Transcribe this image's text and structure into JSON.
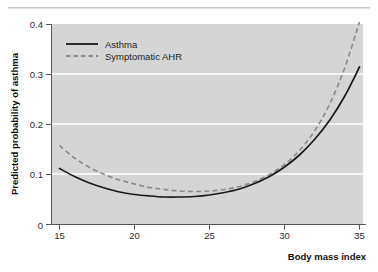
{
  "figure": {
    "background_color": "#ffffff",
    "plot_background_color": "#d5d5d5",
    "grid_color": "#ffffff",
    "top_rule": "horizontal-divider"
  },
  "chart_data": {
    "type": "line",
    "title": "",
    "subtitle": "",
    "xlabel": "Body mass index",
    "ylabel": "Predicted probability of asthma",
    "xlim": [
      14.5,
      35.6
    ],
    "ylim": [
      0,
      0.42
    ],
    "xticks": [
      15,
      20,
      25,
      30,
      35
    ],
    "xticklabels": [
      "15",
      "20",
      "25",
      "30",
      "35"
    ],
    "yticks": [
      0,
      0.1,
      0.2,
      0.3,
      0.4
    ],
    "yticklabels": [
      "0",
      "0.1",
      "0.2",
      "0.3",
      "0.4"
    ],
    "grid": "horizontal-only-at-0.1-0.2-0.3",
    "legend_position": "upper-left-inside",
    "x": [
      15,
      16,
      17,
      18,
      19,
      20,
      21,
      22,
      23,
      24,
      25,
      26,
      27,
      28,
      29,
      30,
      31,
      32,
      33,
      34,
      35
    ],
    "series": [
      {
        "name": "Asthma",
        "style": "solid",
        "color": "#1a1a1a",
        "values": [
          0.112,
          0.096,
          0.083,
          0.073,
          0.065,
          0.06,
          0.057,
          0.055,
          0.055,
          0.056,
          0.059,
          0.064,
          0.071,
          0.082,
          0.096,
          0.115,
          0.139,
          0.17,
          0.208,
          0.256,
          0.315
        ]
      },
      {
        "name": "Symptomatic AHR",
        "style": "dashed",
        "color": "#8d8d8d",
        "values": [
          0.158,
          0.133,
          0.114,
          0.1,
          0.089,
          0.081,
          0.074,
          0.07,
          0.067,
          0.066,
          0.067,
          0.07,
          0.076,
          0.086,
          0.1,
          0.12,
          0.148,
          0.187,
          0.24,
          0.312,
          0.405
        ]
      }
    ],
    "legend": [
      {
        "label": "Asthma",
        "style": "solid",
        "color": "#1a1a1a"
      },
      {
        "label": "Symptomatic AHR",
        "style": "dashed",
        "color": "#8d8d8d"
      }
    ]
  }
}
